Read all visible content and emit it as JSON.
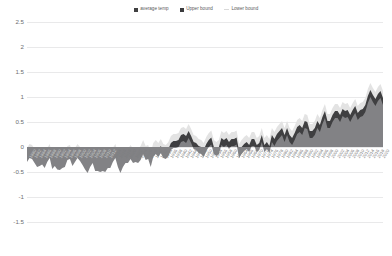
{
  "legend": {
    "position": "top-center",
    "items": [
      {
        "label": "average temp",
        "color": "#404041",
        "marker": "square"
      },
      {
        "label": "Upper bound",
        "color": "#3b3b3d",
        "marker": "square"
      },
      {
        "label": "Lower bound",
        "color": "#d9d9d9",
        "marker": "line"
      }
    ]
  },
  "axes": {
    "y_ticks": [
      "2.5",
      "2",
      "1.5",
      "1",
      "0.5",
      "0",
      "-0.5",
      "-1",
      "-1.5"
    ],
    "y_min": -1.5,
    "y_max": 2.5,
    "grid": true,
    "xlabel": "",
    "ylabel": ""
  },
  "colors": {
    "upper_band": "#e3e3e3",
    "average_band": "#3f3f41",
    "lower_band": "#828285",
    "grid": "#e9e9ea",
    "tick_text": "#6d6e70",
    "xtick_text": "#7d7e80",
    "background": "#ffffff"
  },
  "chart_data": {
    "type": "area",
    "title": "",
    "xlabel": "",
    "ylabel": "",
    "ylim": [
      -1.5,
      2.5
    ],
    "grid": true,
    "legend_position": "top-center",
    "stacked": false,
    "categories": [
      "1880",
      "1881",
      "1882",
      "1883",
      "1884",
      "1885",
      "1886",
      "1887",
      "1888",
      "1889",
      "1890",
      "1891",
      "1892",
      "1893",
      "1894",
      "1895",
      "1896",
      "1897",
      "1898",
      "1899",
      "1900",
      "1901",
      "1902",
      "1903",
      "1904",
      "1905",
      "1906",
      "1907",
      "1908",
      "1909",
      "1910",
      "1911",
      "1912",
      "1913",
      "1914",
      "1915",
      "1916",
      "1917",
      "1918",
      "1919",
      "1920",
      "1921",
      "1922",
      "1923",
      "1924",
      "1925",
      "1926",
      "1927",
      "1928",
      "1929",
      "1930",
      "1931",
      "1932",
      "1933",
      "1934",
      "1935",
      "1936",
      "1937",
      "1938",
      "1939",
      "1940",
      "1941",
      "1942",
      "1943",
      "1944",
      "1945",
      "1946",
      "1947",
      "1948",
      "1949",
      "1950",
      "1951",
      "1952",
      "1953",
      "1954",
      "1955",
      "1956",
      "1957",
      "1958",
      "1959",
      "1960",
      "1961",
      "1962",
      "1963",
      "1964",
      "1965",
      "1966",
      "1967",
      "1968",
      "1969",
      "1970",
      "1971",
      "1972",
      "1973",
      "1974",
      "1975",
      "1976",
      "1977",
      "1978",
      "1979",
      "1980",
      "1981",
      "1982",
      "1983",
      "1984",
      "1985",
      "1986",
      "1987",
      "1988",
      "1989",
      "1990",
      "1991",
      "1992",
      "1993",
      "1994",
      "1995",
      "1996",
      "1997",
      "1998",
      "1999",
      "2000",
      "2001",
      "2002",
      "2003",
      "2004",
      "2005",
      "2006",
      "2007",
      "2008",
      "2009",
      "2010",
      "2011",
      "2012",
      "2013",
      "2014",
      "2015",
      "2016",
      "2017",
      "2018",
      "2019",
      "2020",
      "2021"
    ],
    "series": [
      {
        "name": "Lower bound",
        "color": "#828285",
        "values": [
          -0.3,
          -0.22,
          -0.24,
          -0.32,
          -0.4,
          -0.38,
          -0.35,
          -0.42,
          -0.3,
          -0.22,
          -0.44,
          -0.38,
          -0.45,
          -0.46,
          -0.42,
          -0.4,
          -0.26,
          -0.24,
          -0.38,
          -0.3,
          -0.22,
          -0.28,
          -0.36,
          -0.45,
          -0.52,
          -0.4,
          -0.32,
          -0.48,
          -0.48,
          -0.5,
          -0.48,
          -0.5,
          -0.42,
          -0.42,
          -0.3,
          -0.22,
          -0.4,
          -0.52,
          -0.4,
          -0.32,
          -0.32,
          -0.24,
          -0.32,
          -0.3,
          -0.32,
          -0.26,
          -0.14,
          -0.26,
          -0.24,
          -0.4,
          -0.2,
          -0.14,
          -0.2,
          -0.12,
          -0.22,
          -0.24,
          -0.18,
          -0.06,
          -0.02,
          -0.02,
          0.0,
          0.1,
          0.12,
          0.08,
          0.18,
          0.08,
          -0.04,
          -0.06,
          -0.12,
          -0.14,
          -0.2,
          -0.08,
          0.0,
          0.05,
          -0.14,
          -0.18,
          -0.14,
          0.04,
          0.0,
          0.04,
          -0.04,
          0.02,
          0.02,
          0.05,
          -0.22,
          -0.14,
          -0.08,
          -0.04,
          -0.1,
          0.02,
          0.02,
          -0.1,
          -0.06,
          0.1,
          -0.1,
          -0.04,
          -0.12,
          0.1,
          0.02,
          0.12,
          0.18,
          0.24,
          0.1,
          0.24,
          0.1,
          0.04,
          0.14,
          0.26,
          0.3,
          0.24,
          0.38,
          0.36,
          0.18,
          0.18,
          0.24,
          0.38,
          0.3,
          0.46,
          0.58,
          0.38,
          0.38,
          0.5,
          0.58,
          0.58,
          0.5,
          0.62,
          0.58,
          0.6,
          0.5,
          0.6,
          0.68,
          0.54,
          0.6,
          0.62,
          0.7,
          0.88,
          1.0,
          0.9,
          0.82,
          0.92,
          0.98,
          0.84
        ]
      },
      {
        "name": "average temp",
        "color": "#3f3f41",
        "values": [
          -0.16,
          -0.08,
          -0.1,
          -0.18,
          -0.26,
          -0.24,
          -0.21,
          -0.28,
          -0.16,
          -0.08,
          -0.3,
          -0.24,
          -0.31,
          -0.32,
          -0.28,
          -0.26,
          -0.12,
          -0.1,
          -0.24,
          -0.16,
          -0.08,
          -0.14,
          -0.22,
          -0.31,
          -0.38,
          -0.26,
          -0.18,
          -0.34,
          -0.34,
          -0.36,
          -0.34,
          -0.36,
          -0.28,
          -0.28,
          -0.16,
          -0.08,
          -0.26,
          -0.38,
          -0.26,
          -0.18,
          -0.18,
          -0.1,
          -0.18,
          -0.16,
          -0.18,
          -0.12,
          0.0,
          -0.12,
          -0.1,
          -0.26,
          -0.06,
          0.0,
          -0.06,
          0.02,
          -0.08,
          -0.1,
          -0.04,
          0.08,
          0.12,
          0.12,
          0.14,
          0.24,
          0.26,
          0.22,
          0.32,
          0.22,
          0.1,
          0.08,
          0.02,
          0.0,
          -0.06,
          0.06,
          0.14,
          0.19,
          0.0,
          -0.04,
          0.0,
          0.18,
          0.14,
          0.18,
          0.1,
          0.16,
          0.16,
          0.19,
          -0.08,
          0.0,
          0.06,
          0.1,
          0.04,
          0.16,
          0.16,
          0.04,
          0.08,
          0.24,
          0.04,
          0.1,
          0.02,
          0.24,
          0.16,
          0.26,
          0.32,
          0.38,
          0.24,
          0.38,
          0.24,
          0.18,
          0.28,
          0.4,
          0.44,
          0.38,
          0.52,
          0.5,
          0.32,
          0.32,
          0.38,
          0.52,
          0.44,
          0.6,
          0.72,
          0.52,
          0.52,
          0.64,
          0.72,
          0.72,
          0.64,
          0.76,
          0.72,
          0.74,
          0.64,
          0.74,
          0.82,
          0.68,
          0.74,
          0.76,
          0.84,
          1.02,
          1.14,
          1.04,
          0.96,
          1.06,
          1.12,
          0.98
        ]
      },
      {
        "name": "Upper bound",
        "color": "#e3e3e3",
        "values": [
          -0.02,
          0.06,
          0.04,
          -0.04,
          -0.12,
          -0.1,
          -0.07,
          -0.14,
          -0.02,
          0.06,
          -0.16,
          -0.1,
          -0.17,
          -0.18,
          -0.14,
          -0.12,
          0.02,
          0.04,
          -0.1,
          -0.02,
          0.06,
          0.0,
          -0.08,
          -0.17,
          -0.24,
          -0.12,
          -0.04,
          -0.2,
          -0.2,
          -0.22,
          -0.2,
          -0.22,
          -0.14,
          -0.14,
          -0.02,
          0.06,
          -0.12,
          -0.24,
          -0.12,
          -0.04,
          -0.04,
          0.04,
          -0.04,
          -0.02,
          -0.04,
          0.02,
          0.14,
          0.02,
          0.04,
          -0.12,
          0.08,
          0.14,
          0.08,
          0.16,
          0.06,
          0.04,
          0.1,
          0.22,
          0.26,
          0.26,
          0.28,
          0.38,
          0.4,
          0.36,
          0.46,
          0.36,
          0.24,
          0.22,
          0.16,
          0.14,
          0.08,
          0.2,
          0.28,
          0.33,
          0.14,
          0.1,
          0.14,
          0.32,
          0.28,
          0.32,
          0.24,
          0.3,
          0.3,
          0.33,
          0.06,
          0.14,
          0.2,
          0.24,
          0.18,
          0.3,
          0.3,
          0.18,
          0.22,
          0.38,
          0.18,
          0.24,
          0.16,
          0.38,
          0.3,
          0.4,
          0.46,
          0.52,
          0.38,
          0.52,
          0.38,
          0.32,
          0.42,
          0.54,
          0.58,
          0.52,
          0.66,
          0.64,
          0.46,
          0.46,
          0.52,
          0.66,
          0.58,
          0.74,
          0.86,
          0.66,
          0.66,
          0.78,
          0.86,
          0.86,
          0.78,
          0.9,
          0.86,
          0.88,
          0.78,
          0.88,
          0.96,
          0.82,
          0.88,
          0.9,
          0.98,
          1.16,
          1.28,
          1.18,
          1.1,
          1.2,
          1.26,
          1.12
        ]
      }
    ]
  }
}
